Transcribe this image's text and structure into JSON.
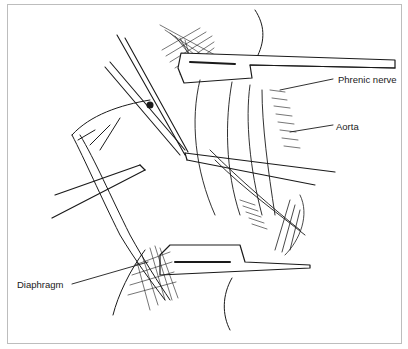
{
  "figure": {
    "type": "surgical-illustration",
    "style": "black-and-white line drawing",
    "labels": [
      {
        "id": "phrenic",
        "text": "Phrenic nerve"
      },
      {
        "id": "aorta",
        "text": "Aorta"
      },
      {
        "id": "diaphragm",
        "text": "Diaphragm"
      }
    ],
    "colors": {
      "ink": "#1a1a1a",
      "frame": "#bdbdbd",
      "background": "#ffffff"
    }
  }
}
